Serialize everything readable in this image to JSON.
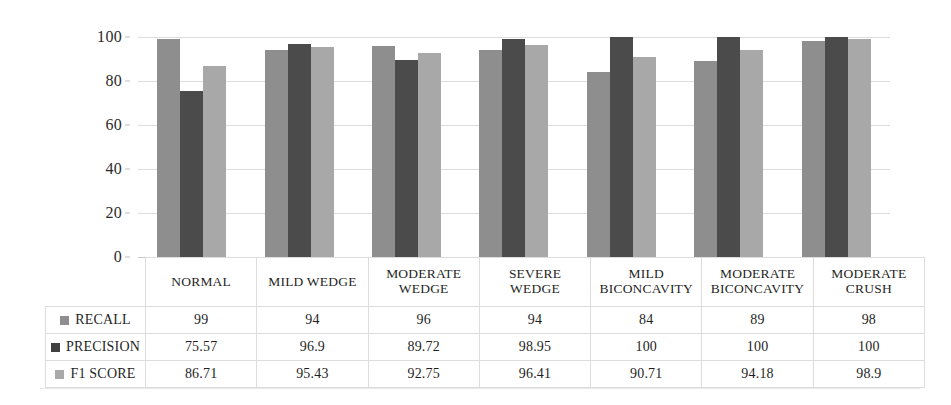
{
  "chart_data": {
    "type": "bar",
    "title": "",
    "xlabel": "",
    "ylabel": "",
    "ylim": [
      0,
      100
    ],
    "yticks": [
      100,
      80,
      60,
      40,
      20,
      0
    ],
    "grid": true,
    "legend_position": "table-left-column",
    "categories": [
      "NORMAL",
      "MILD WEDGE",
      "MODERATE WEDGE",
      "SEVERE WEDGE",
      "MILD BICONCAVITY",
      "MODERATE BICONCAVITY",
      "MODERATE CRUSH"
    ],
    "series": [
      {
        "name": "RECALL",
        "color": "#8e8e8e",
        "values": [
          99,
          94,
          96,
          94,
          84,
          89,
          98
        ]
      },
      {
        "name": "PRECISION",
        "color": "#4b4b4b",
        "values": [
          75.57,
          96.9,
          89.72,
          98.95,
          100,
          100,
          100
        ]
      },
      {
        "name": "F1 SCORE",
        "color": "#a8a8a8",
        "values": [
          86.71,
          95.43,
          92.75,
          96.41,
          90.71,
          94.18,
          98.9
        ]
      }
    ]
  },
  "table": {
    "corner_label": "",
    "column_headers": [
      "NORMAL",
      "MILD WEDGE",
      "MODERATE WEDGE",
      "SEVERE WEDGE",
      "MILD BICONCAVITY",
      "MODERATE BICONCAVITY",
      "MODERATE CRUSH"
    ],
    "rows": [
      {
        "label": "RECALL",
        "swatch_color": "#8e8e8e",
        "cells": [
          "99",
          "94",
          "96",
          "94",
          "84",
          "89",
          "98"
        ]
      },
      {
        "label": "PRECISION",
        "swatch_color": "#3f3f3f",
        "cells": [
          "75.57",
          "96.9",
          "89.72",
          "98.95",
          "100",
          "100",
          "100"
        ]
      },
      {
        "label": "F1 SCORE",
        "swatch_color": "#a8a8a8",
        "cells": [
          "86.71",
          "95.43",
          "92.75",
          "96.41",
          "90.71",
          "94.18",
          "98.9"
        ]
      }
    ]
  },
  "axis": {
    "y_tick_labels": [
      "100",
      "80",
      "60",
      "40",
      "20",
      "0"
    ]
  }
}
